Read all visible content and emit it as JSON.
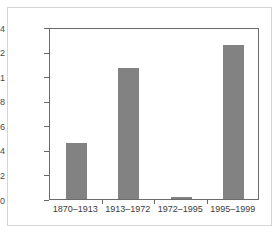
{
  "chart_data": {
    "type": "bar",
    "title": "",
    "subtitle": "",
    "xlabel": "",
    "ylabel": "",
    "categories": [
      "1870–1913",
      "1913–1972",
      "1972–1995",
      "1995–1999"
    ],
    "values": [
      0.46,
      1.07,
      0.02,
      1.25
    ],
    "ylim": [
      0,
      1.4
    ],
    "ytick_labels": [
      "0",
      "0.2",
      "0.4",
      "0.6",
      "0.8",
      "1",
      "1.2",
      "1.4"
    ],
    "ytick_values": [
      0,
      0.2,
      0.4,
      0.6,
      0.8,
      1,
      1.2,
      1.4
    ],
    "grid": false,
    "legend": null,
    "legend_position": "none",
    "annotations": [],
    "bar_color": "#828282",
    "axis_color": "#6b6b6b",
    "plot_background": "#ffffff",
    "frame_color": "#d5d5d5"
  }
}
